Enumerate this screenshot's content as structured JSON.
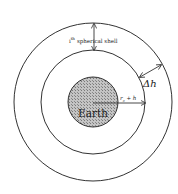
{
  "diagram": {
    "earth_label": "Earth",
    "shell_label_index": "i",
    "shell_label_suffix": "th",
    "shell_label_text": "spherical shell",
    "delta_label": "Δh",
    "radius_label_r": "r",
    "radius_label_sub": "e",
    "radius_label_rest": " + h",
    "colors": {
      "stroke": "#333333",
      "earth_fill": "#b8b8b8",
      "earth_hatch": "#7a7a7a",
      "background": "#ffffff"
    }
  }
}
